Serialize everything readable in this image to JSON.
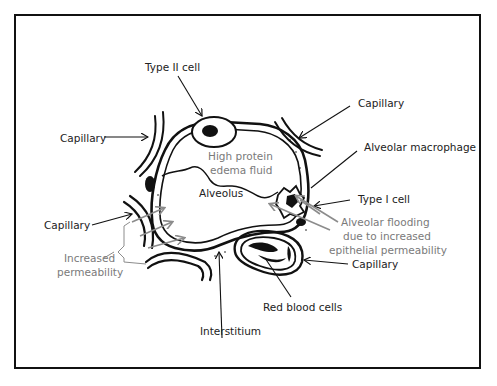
{
  "diagram": {
    "labels": {
      "type_ii_cell": "Type II cell",
      "capillary_top_left": "Capillary",
      "capillary_top_right": "Capillary",
      "alveolar_macrophage": "Alveolar macrophage",
      "high_protein_line1": "High protein",
      "high_protein_line2": "edema fluid",
      "alveolus": "Alveolus",
      "type_i_cell": "Type I cell",
      "capillary_left": "Capillary",
      "increased_perm_line1": "Increased",
      "increased_perm_line2": "permeability",
      "flooding_line1": "Alveolar flooding",
      "flooding_line2": "due to increased",
      "flooding_line3": "epithelial permeability",
      "capillary_bottom_right": "Capillary",
      "red_blood_cells": "Red blood cells",
      "interstitium": "Interstitium"
    },
    "colors": {
      "ink": "#111111",
      "gray_annotation": "#7a7a7a",
      "gray_arrow": "#8c8c8c",
      "frame": "#111111"
    }
  }
}
